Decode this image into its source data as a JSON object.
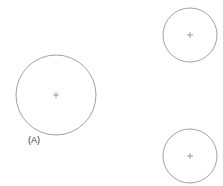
{
  "diagram": {
    "stroke_color": "#8a8a8a",
    "center_mark_color": "#777777",
    "circles": [
      {
        "id": "A",
        "cx": 56,
        "cy": 95,
        "r": 40,
        "label": "(A)"
      },
      {
        "id": "top-right",
        "cx": 190,
        "cy": 35,
        "r": 27
      },
      {
        "id": "bottom-right",
        "cx": 190,
        "cy": 156,
        "r": 27
      }
    ],
    "label_a": "(A)"
  }
}
